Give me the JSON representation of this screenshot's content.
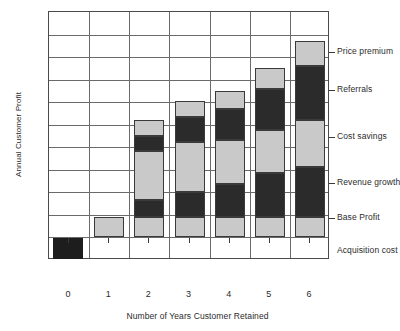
{
  "chart_data": {
    "type": "bar",
    "title": "",
    "subtitle": "",
    "xlabel": "Number of Years Customer Retained",
    "ylabel": "Annual Customer Profit",
    "categories": [
      "0",
      "1",
      "2",
      "3",
      "4",
      "5",
      "6"
    ],
    "stacked": true,
    "grid": true,
    "legend_position": "right-axis-labels",
    "ylim": [
      -1,
      11
    ],
    "y_tick_count": 11,
    "series": [
      {
        "name": "Acquisition cost",
        "shade": "dark",
        "values": [
          -1,
          0,
          0,
          0,
          0,
          0,
          0
        ]
      },
      {
        "name": "Base Profit",
        "shade": "light",
        "values": [
          0,
          1,
          1,
          1,
          1,
          1,
          1
        ]
      },
      {
        "name": "Revenue growth",
        "shade": "dark",
        "values": [
          0,
          0,
          0.8,
          1.2,
          1.6,
          2.1,
          2.4
        ]
      },
      {
        "name": "Cost savings",
        "shade": "light",
        "values": [
          0,
          0,
          2.4,
          2.4,
          2.1,
          2.1,
          2.3
        ]
      },
      {
        "name": "Referrals",
        "shade": "dark",
        "values": [
          0,
          0,
          0.7,
          1.2,
          1.5,
          2.0,
          2.6
        ]
      },
      {
        "name": "Price premium",
        "shade": "light",
        "values": [
          0,
          0,
          0.8,
          0.8,
          0.9,
          1.0,
          1.2
        ]
      }
    ],
    "stack_totals": [
      -1,
      1,
      5.7,
      6.6,
      7.1,
      8.2,
      9.5
    ],
    "annotations": [
      {
        "label": "Price premium",
        "at_y": 9.0
      },
      {
        "label": "Referrals",
        "at_y": 7.2
      },
      {
        "label": "Cost savings",
        "at_y": 4.9
      },
      {
        "label": "Revenue growth",
        "at_y": 2.7
      },
      {
        "label": "Base Profit",
        "at_y": 1.0
      },
      {
        "label": "Acquisition cost",
        "at_y": -0.6
      }
    ],
    "colors": {
      "light_segment": "#c9c9c9",
      "dark_segment": "#2b2b2b",
      "acquisition_cost": "#1d1d1d",
      "grid": "#6a6a6a",
      "frame": "#4a4a4a",
      "text": "#2b2b2b",
      "background": "#ffffff"
    }
  },
  "axes": {
    "y_title": "Annual Customer Profit",
    "x_title": "Number of Years Customer Retained",
    "x_tick_labels": [
      "0",
      "1",
      "2",
      "3",
      "4",
      "5",
      "6"
    ]
  },
  "right_labels": [
    "Price premium",
    "Referrals",
    "Cost savings",
    "Revenue growth",
    "Base Profit",
    "Acquisition cost"
  ]
}
